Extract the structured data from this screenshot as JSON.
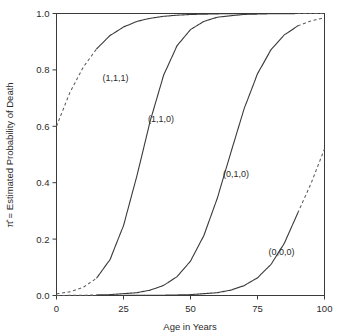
{
  "chart_data": {
    "type": "line",
    "title": "",
    "xlabel": "Age in Years",
    "ylabel": "π̂ = Estimated Probability of Death",
    "xlim": [
      0,
      100
    ],
    "ylim": [
      0.0,
      1.0
    ],
    "xticks": [
      0,
      25,
      50,
      75,
      100
    ],
    "xtick_labels": [
      "0",
      "25",
      "50",
      "75",
      "100"
    ],
    "yticks": [
      0.0,
      0.2,
      0.4,
      0.6,
      0.8,
      1.0
    ],
    "ytick_labels": [
      "0.0",
      "0.2",
      "0.4",
      "0.6",
      "0.8",
      "1.0"
    ],
    "grid": false,
    "legend": "inline-annotations",
    "observed_age_range": [
      15,
      90
    ],
    "note": "Solid line segments span the observed age range; dashed segments are extrapolations outside it.",
    "series": [
      {
        "name": "(1,1,1)",
        "label": "(1,1,1)",
        "label_x": 22,
        "label_y": 0.76,
        "x": [
          0,
          5,
          10,
          15,
          20,
          25,
          30,
          35,
          40,
          45,
          50,
          60,
          70,
          80,
          90,
          95,
          100
        ],
        "values": [
          0.6,
          0.72,
          0.81,
          0.875,
          0.922,
          0.952,
          0.972,
          0.983,
          0.99,
          0.994,
          0.9965,
          0.9988,
          0.9996,
          0.9999,
          1.0,
          1.0,
          1.0
        ]
      },
      {
        "name": "(1,1,0)",
        "label": "(1,1,0)",
        "label_x": 39,
        "label_y": 0.615,
        "x": [
          0,
          5,
          10,
          15,
          20,
          25,
          30,
          35,
          40,
          45,
          50,
          55,
          60,
          70,
          80,
          90,
          100
        ],
        "values": [
          0.006,
          0.013,
          0.029,
          0.062,
          0.128,
          0.248,
          0.424,
          0.62,
          0.782,
          0.886,
          0.943,
          0.972,
          0.987,
          0.9968,
          0.9992,
          0.9998,
          1.0
        ]
      },
      {
        "name": "(0,1,0)",
        "label": "(0,1,0)",
        "label_x": 67,
        "label_y": 0.42,
        "x": [
          0,
          10,
          20,
          30,
          35,
          40,
          45,
          50,
          55,
          60,
          65,
          70,
          75,
          80,
          85,
          90,
          95,
          100
        ],
        "values": [
          0.0,
          0.001,
          0.003,
          0.01,
          0.019,
          0.036,
          0.067,
          0.122,
          0.213,
          0.345,
          0.505,
          0.662,
          0.786,
          0.871,
          0.924,
          0.956,
          0.974,
          0.985
        ]
      },
      {
        "name": "(0,0,0)",
        "label": "(0,0,0)",
        "label_x": 84,
        "label_y": 0.145,
        "x": [
          0,
          20,
          40,
          50,
          60,
          65,
          70,
          75,
          80,
          85,
          90,
          95,
          100
        ],
        "values": [
          0.0,
          0.0,
          0.001,
          0.003,
          0.01,
          0.019,
          0.035,
          0.063,
          0.11,
          0.185,
          0.292,
          0.398,
          0.52
        ]
      }
    ]
  },
  "axes": {
    "xlabel": "Age in Years",
    "ylabel": "π̂ = Estimated Probability of Death"
  }
}
